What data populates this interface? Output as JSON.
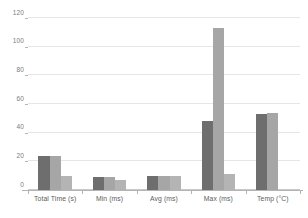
{
  "chart_data": {
    "type": "bar",
    "title": "",
    "subtitle": "",
    "xlabel": "",
    "ylabel": "",
    "categories": [
      "Total Time (s)",
      "Min (ms)",
      "Avg (ms)",
      "Max (ms)",
      "Temp (°C)"
    ],
    "series": [
      {
        "name": "Series 1",
        "color": "#6e6e6e",
        "values": [
          24,
          9,
          9.5,
          48,
          53
        ]
      },
      {
        "name": "Series 2",
        "color": "#a6a6a6",
        "values": [
          24,
          9,
          10,
          113,
          54
        ]
      },
      {
        "name": "Series 3",
        "color": "#b4b4b4",
        "values": [
          10,
          7,
          10,
          11,
          0
        ]
      }
    ],
    "ylim": [
      0,
      120
    ],
    "yticks": [
      0,
      20,
      40,
      60,
      80,
      100,
      120
    ],
    "ytick_labels": [
      "0",
      "20",
      "40",
      "60",
      "80",
      "100",
      "120"
    ],
    "grid": true,
    "grid_axis": "y",
    "grid_color": "#e6e6e6",
    "legend": false,
    "legend_position": "none",
    "axis_color": "#b4b4b4",
    "tick_label_color": "#7a7a7a",
    "background": "#ffffff"
  }
}
